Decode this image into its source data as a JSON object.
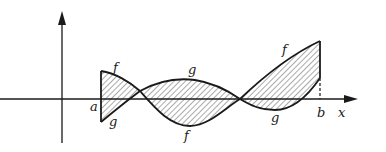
{
  "figure": {
    "labels": {
      "f_left": "f",
      "g_left": "g",
      "g_top": "g",
      "f_bottom": "f",
      "f_right": "f",
      "g_right": "g",
      "a": "a",
      "b": "b",
      "x_axis": "x"
    },
    "colors": {
      "stroke": "#1a1a1a",
      "hatch": "#555555",
      "background": "#ffffff"
    }
  }
}
